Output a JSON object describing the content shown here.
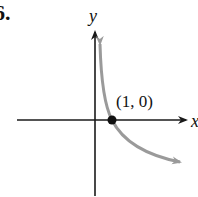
{
  "problem_number": "6.",
  "graph": {
    "x_axis_label": "x",
    "y_axis_label": "y",
    "point_label": "(1, 0)",
    "point": {
      "x": 1,
      "y": 0
    },
    "curve_description": "decreasing curve through (1, 0), asymptotic to y-axis, like y = -ln x",
    "colors": {
      "axes": "#1a1a1a",
      "curve": "#9a9a9a",
      "point": "#111111"
    }
  }
}
